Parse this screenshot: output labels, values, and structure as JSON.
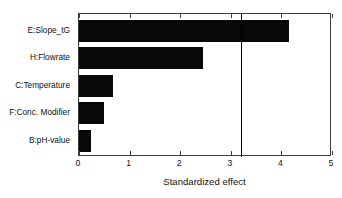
{
  "chart_data": {
    "type": "bar",
    "orientation": "horizontal",
    "title": "",
    "subtitle": "",
    "xlabel": "Standardized effect",
    "ylabel": "",
    "categories": [
      "E:Slope_tG",
      "H:Flowrate",
      "C:Temperature",
      "F:Conc. Modifier",
      "B:pH-value"
    ],
    "values": [
      4.16,
      2.45,
      0.67,
      0.5,
      0.23
    ],
    "xlim": [
      0,
      5
    ],
    "ylim": null,
    "xticks": [
      0,
      1,
      2,
      3,
      4,
      5
    ],
    "xtick_labels": [
      "0",
      "1",
      "2",
      "3",
      "4",
      "5"
    ],
    "grid": false,
    "legend": null,
    "annotations": [
      {
        "name": "significance-threshold",
        "type": "vertical-line",
        "value": 3.21,
        "label": ""
      }
    ],
    "bar_color": "#080808",
    "line_color": "#000000",
    "frame_color": "#3c3c3c",
    "background": "#ffffff"
  },
  "axis": {
    "x_title": "Standardized effect"
  }
}
